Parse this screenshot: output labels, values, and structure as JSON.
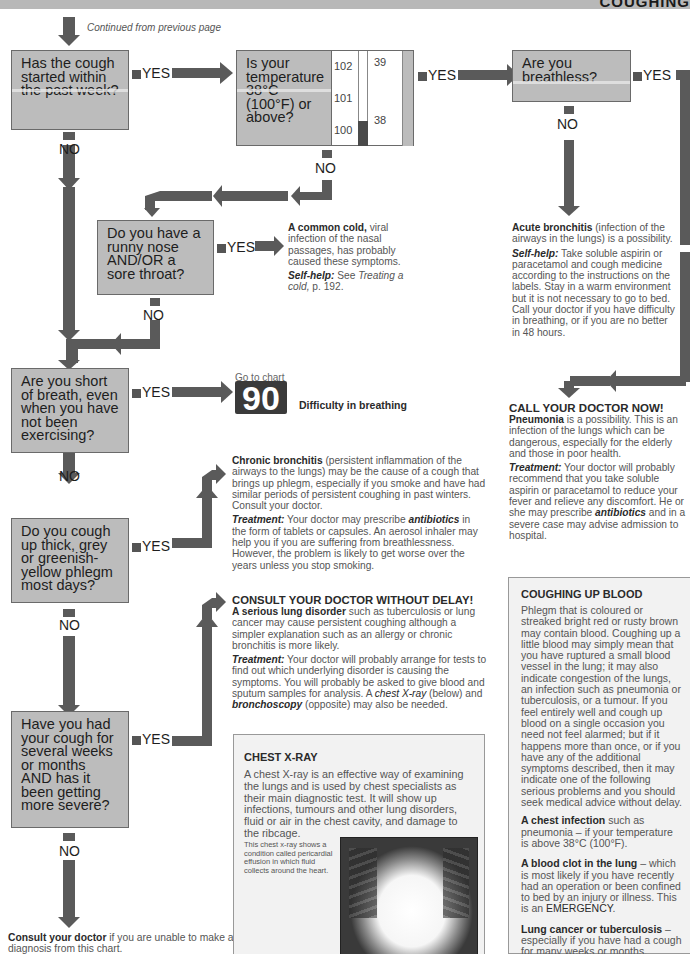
{
  "header": {
    "title": "COUGHING"
  },
  "continued_note": "Continued from previous page",
  "labels": {
    "yes": "YES",
    "no": "NO"
  },
  "questions": [
    {
      "id": "q1",
      "text": "Has the cough started within the past week?"
    },
    {
      "id": "q2",
      "text": "Is your temperature 38°C (100°F) or above?"
    },
    {
      "id": "q3",
      "text": "Are you breathless?"
    },
    {
      "id": "q4",
      "text": "Do you have a runny nose AND/OR a sore throat?"
    },
    {
      "id": "q5",
      "text": "Are you short of breath, even when you have not been exercising?"
    },
    {
      "id": "q6",
      "text": "Do you cough up thick, grey or greenish-yellow phlegm most days?"
    },
    {
      "id": "q7",
      "text": "Have you had your cough for several weeks or months AND has it been getting more severe?"
    }
  ],
  "thermometer": {
    "fahrenheit_ticks": [
      "102",
      "101",
      "100"
    ],
    "celsius_ticks": [
      "39",
      "38"
    ]
  },
  "outcomes": {
    "common_cold": {
      "title": "A common cold,",
      "body": " viral infection of the nasal passages, has probably caused these symptoms.",
      "selfhelp_label": "Self-help:",
      "selfhelp_body": " See ",
      "selfhelp_ref": "Treating a cold,",
      "selfhelp_page": " p. 192."
    },
    "acute_bronchitis": {
      "title": "Acute bronchitis",
      "body": " (infection of the airways in the lungs) is a possibility.",
      "selfhelp_label": "Self-help:",
      "selfhelp_body": " Take soluble aspirin or paracetamol and cough medicine according to the instructions on the labels. Stay in a warm environment but it is not necessary to go to bed. Call your doctor if you have difficulty in breathing, or if you are no better in 48 hours."
    },
    "pneumonia": {
      "alert": "CALL YOUR DOCTOR NOW!",
      "title": "Pneumonia",
      "body": " is a possibility. This is an infection of the lungs which can be dangerous, especially for the elderly and those in poor health.",
      "treatment_label": "Treatment:",
      "treatment_body_1": " Your doctor will probably recommend that you take soluble aspirin or paracetamol to reduce your fever and relieve any discomfort. He or she may prescribe ",
      "treatment_em": "antibiotics",
      "treatment_body_2": " and in a severe case may advise admission to hospital."
    },
    "goto_chart": {
      "prefix": "Go to chart",
      "number": "90",
      "label": "Difficulty in breathing"
    },
    "chronic_bronchitis": {
      "title": "Chronic bronchitis",
      "body": " (persistent inflammation of the airways to the lungs) may be the cause of a cough that brings up phlegm, especially if you smoke and have had similar periods of persistent coughing in past winters. Consult your doctor.",
      "treatment_label": "Treatment:",
      "treatment_body_1": " Your doctor may prescribe ",
      "treatment_em": "antibiotics",
      "treatment_body_2": " in the form of tablets or capsules. An aerosol inhaler may help you if you are suffering from breathlessness. However, the problem is likely to get worse over the years unless you stop smoking."
    },
    "serious_lung": {
      "alert": "CONSULT YOUR DOCTOR WITHOUT DELAY!",
      "title": "A serious lung disorder",
      "body": " such as tuberculosis or lung cancer may cause persistent coughing although a simpler explanation such as an allergy or chronic bronchitis is more likely.",
      "treatment_label": "Treatment:",
      "treatment_body_1": " Your doctor will probably arrange for tests to find out which underlying disorder is causing the symptoms. You will probably be asked to give blood and sputum samples for analysis. A ",
      "treatment_em1": "chest X-ray",
      "treatment_body_2": " (below) and ",
      "treatment_em2": "bronchoscopy",
      "treatment_body_3": " (opposite) may also be needed."
    },
    "consult": {
      "title": "Consult your doctor",
      "body": " if you are unable to make a diagnosis from this chart."
    }
  },
  "chest_xray_box": {
    "title": "CHEST X-RAY",
    "body": "A chest X-ray is an effective way of examining the lungs and is used by chest specialists as their main diagnostic test. It will show up infections, tumours and other lung disorders, fluid or air in the chest cavity, and damage to the ribcage.",
    "caption": "This chest x-ray shows a condition called pericardial effusion in which fluid collects around the heart."
  },
  "coughing_blood_box": {
    "title": "COUGHING UP BLOOD",
    "body": "Phlegm that is coloured or streaked bright red or rusty brown may contain blood. Coughing up a little blood may simply mean that you have ruptured a small blood vessel in the lung; it may also indicate congestion of the lungs, an infection such as pneumonia or tuberculosis, or a tumour. If you feel entirely well and cough up blood on a single occasion you need not feel alarmed; but if it happens more than once, or if you have any of the additional symptoms described, then it may indicate one of the following serious problems and you should seek medical advice without delay.",
    "items": [
      {
        "title": "A chest infection",
        "body": " such as pneumonia – if your temperature is above 38°C (100°F)."
      },
      {
        "title": "A blood clot in the lung",
        "body": " – which is most likely if you have recently had an operation or been confined to bed by an injury or illness. This is an ",
        "emph": "EMERGENCY",
        "tail": "."
      },
      {
        "title": "Lung cancer or tuberculosis",
        "body": " – especially if you have had a cough for many weeks or months."
      }
    ]
  }
}
